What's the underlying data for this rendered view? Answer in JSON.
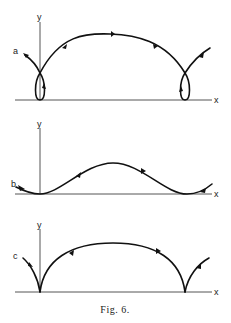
{
  "figure": {
    "caption": "Fig. 6.",
    "panels": [
      {
        "id": "a",
        "label": "a",
        "x_axis_label": "x",
        "y_axis_label": "y",
        "description": "trajectory with loops at ends (curtate trochoid-like)"
      },
      {
        "id": "b",
        "label": "b",
        "x_axis_label": "x",
        "y_axis_label": "y",
        "description": "smooth wave trajectory (prolate trochoid-like)"
      },
      {
        "id": "c",
        "label": "c",
        "x_axis_label": "x",
        "y_axis_label": "y",
        "description": "cycloid with cusps on x-axis"
      }
    ]
  },
  "colors": {
    "curve": "#111111",
    "axis": "#555555",
    "background": "#ffffff"
  }
}
